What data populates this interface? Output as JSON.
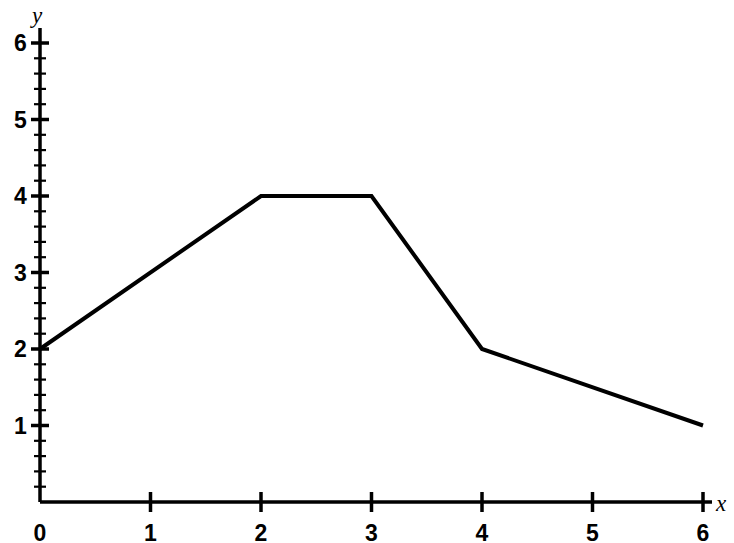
{
  "chart_data": {
    "type": "line",
    "title": "",
    "subtitle": "",
    "xlabel": "x",
    "ylabel": "y",
    "xlim": [
      0,
      6
    ],
    "ylim": [
      0,
      6
    ],
    "grid": false,
    "legend": false,
    "legend_position": "none",
    "line_color": "#000000",
    "background_color": "#ffffff",
    "x_ticks": [
      0,
      1,
      2,
      3,
      4,
      5,
      6
    ],
    "y_ticks": [
      0,
      1,
      2,
      3,
      4,
      5,
      6
    ],
    "x_tick_labels": [
      "0",
      "1",
      "2",
      "3",
      "4",
      "5",
      "6"
    ],
    "y_tick_labels": [
      "0",
      "1",
      "2",
      "3",
      "4",
      "5",
      "6"
    ],
    "y_minor_tick_step": 0.2,
    "x": [
      0,
      2,
      3,
      4,
      6
    ],
    "values": [
      2,
      4,
      4,
      2,
      1
    ],
    "points": [
      {
        "x": 0,
        "y": 2
      },
      {
        "x": 2,
        "y": 4
      },
      {
        "x": 3,
        "y": 4
      },
      {
        "x": 4,
        "y": 2
      },
      {
        "x": 6,
        "y": 1
      }
    ]
  }
}
